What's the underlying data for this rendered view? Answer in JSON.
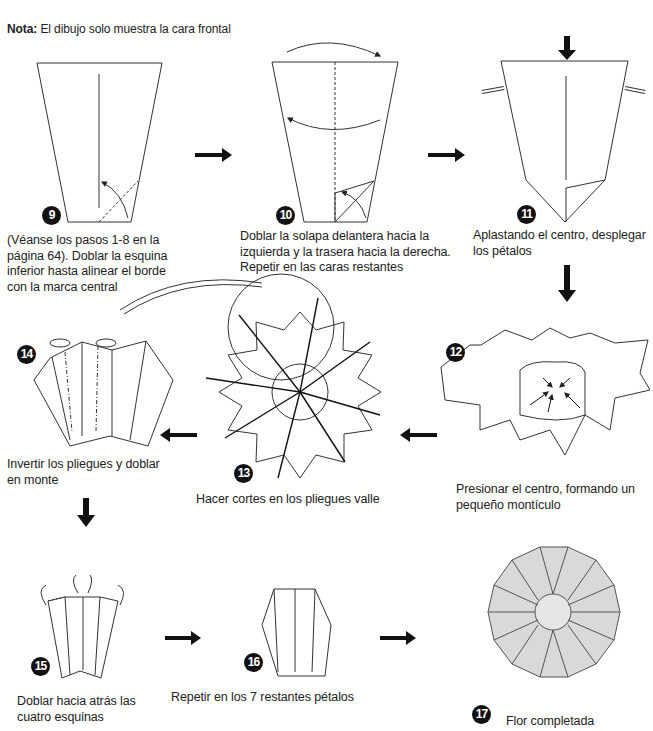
{
  "note": {
    "label": "Nota:",
    "text": "El dibujo solo muestra la cara frontal"
  },
  "steps": [
    {
      "number": "9",
      "caption": [
        "(Véanse los pasos 1-8 en la",
        "página 64). Doblar la esquina",
        "inferior hasta alinear el borde",
        "con la marca central"
      ]
    },
    {
      "number": "10",
      "caption": [
        "Doblar la solapa delantera hacia la",
        "izquierda y la trasera hacia la derecha.",
        "Repetir en las caras restantes"
      ]
    },
    {
      "number": "11",
      "caption": [
        "Aplastando el centro, desplegar",
        "los pétalos"
      ]
    },
    {
      "number": "12",
      "caption": [
        "Presionar el centro, formando un",
        "pequeño montículo"
      ]
    },
    {
      "number": "13",
      "caption": [
        "Hacer cortes en los pliegues valle"
      ]
    },
    {
      "number": "14",
      "caption": [
        "Invertir los pliegues y doblar",
        "en monte"
      ]
    },
    {
      "number": "15",
      "caption": [
        "Doblar hacia atrás las",
        "cuatro esquinas"
      ]
    },
    {
      "number": "16",
      "caption": [
        "Repetir en los 7 restantes pétalos"
      ]
    },
    {
      "number": "17",
      "caption": [
        "Flor completada"
      ]
    }
  ],
  "colors": {
    "line": "#333333",
    "petal_fill": "#d9d9d9",
    "badge": "#111111"
  }
}
